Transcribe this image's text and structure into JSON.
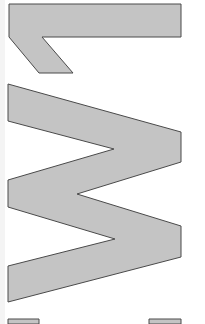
{
  "canvas": {
    "width": 205,
    "height": 324,
    "background": "#ffffff"
  },
  "style": {
    "fill": "#c4c4c4",
    "stroke": "#4a4a4a",
    "stroke_width": 1
  },
  "shapes": [
    {
      "name": "glyph-l-shape",
      "points": "9,4 181,4 181,37 42,37 73,73 39,73 9,37"
    },
    {
      "name": "glyph-w-shape",
      "points": "8,84 181,132 181,162 77,194 181,226 181,257 8,302 8,266 115,239 8,207 8,180 114,149 8,121"
    },
    {
      "name": "bottom-left-block",
      "points": "8,319 39,319 39,324 8,324"
    },
    {
      "name": "bottom-right-block",
      "points": "149,319 181,319 181,324 149,324"
    }
  ]
}
